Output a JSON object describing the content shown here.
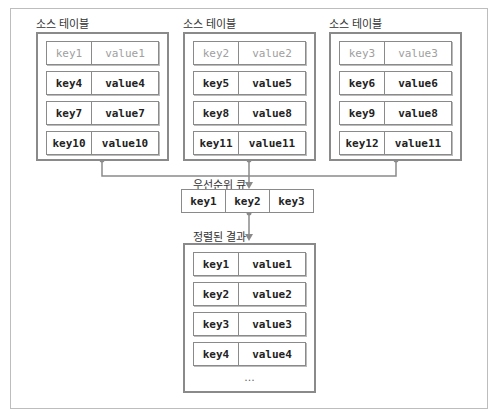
{
  "source_tables": [
    {
      "label": "소스 테이블",
      "rows": [
        {
          "key": "key1",
          "value": "value1",
          "dimmed": true
        },
        {
          "key": "key4",
          "value": "value4"
        },
        {
          "key": "key7",
          "value": "value7"
        },
        {
          "key": "key10",
          "value": "value10"
        }
      ]
    },
    {
      "label": "소스 테이블",
      "rows": [
        {
          "key": "key2",
          "value": "value2",
          "dimmed": true
        },
        {
          "key": "key5",
          "value": "value5"
        },
        {
          "key": "key8",
          "value": "value8"
        },
        {
          "key": "key11",
          "value": "value11"
        }
      ]
    },
    {
      "label": "소스 테이블",
      "rows": [
        {
          "key": "key3",
          "value": "value3",
          "dimmed": true
        },
        {
          "key": "key6",
          "value": "value6"
        },
        {
          "key": "key9",
          "value": "value8"
        },
        {
          "key": "key12",
          "value": "value11"
        }
      ]
    }
  ],
  "priority_queue": {
    "label": "우선순위 큐",
    "cells": [
      "key1",
      "key2",
      "key3"
    ]
  },
  "sorted_result": {
    "label": "정렬된 결과",
    "rows": [
      {
        "key": "key1",
        "value": "value1"
      },
      {
        "key": "key2",
        "value": "value2"
      },
      {
        "key": "key3",
        "value": "value3"
      },
      {
        "key": "key4",
        "value": "value4"
      }
    ],
    "ellipsis": "..."
  },
  "colors": {
    "border": "#8a8a8a",
    "dim_text": "#a0a0a0",
    "text": "#222222"
  }
}
